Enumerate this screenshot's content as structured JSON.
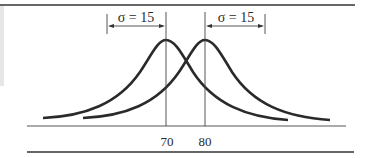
{
  "diagram": {
    "type": "overlapping-normal-distributions",
    "colors": {
      "ink": "#2a2a2a",
      "rule": "#333333",
      "panel": "#e6e6e6"
    },
    "distributions": [
      {
        "name": "left-curve",
        "mean": 70,
        "sigma": 15
      },
      {
        "name": "right-curve",
        "mean": 80,
        "sigma": 15
      }
    ],
    "annotations": {
      "left_sigma_label": "σ = 15",
      "right_sigma_label": "σ = 15"
    },
    "axis": {
      "tick_labels": [
        "70",
        "80"
      ]
    }
  }
}
